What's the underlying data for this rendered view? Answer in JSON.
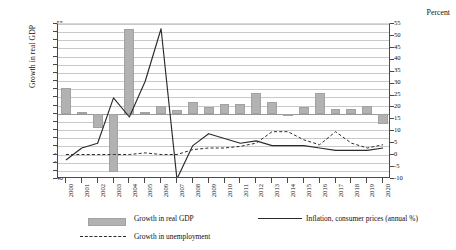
{
  "axis": {
    "y_left_title": "Growth in real GDP",
    "y_right_title": "Percent",
    "y_left_ticks": [
      "55",
      "50",
      "45",
      "40",
      "35",
      "30",
      "25",
      "20",
      "15",
      "10",
      "5",
      "0",
      "-5",
      "-10",
      "-15",
      "-20",
      "-25",
      "-30",
      "-35",
      "-40"
    ],
    "y_right_ticks": [
      "55",
      "50",
      "45",
      "40",
      "35",
      "30",
      "25",
      "20",
      "15",
      "10",
      "5",
      "0",
      "-5",
      "-10"
    ]
  },
  "legend": {
    "items": [
      {
        "label": "Growth in real GDP",
        "marker": "bar",
        "color": "#b2b2b2"
      },
      {
        "label": "Growth in unemployment",
        "marker": "dashed-line",
        "color": "#2b2b2b"
      },
      {
        "label": "Inflation, consumer prices (annual %)",
        "marker": "solid-line",
        "color": "#2b2b2b"
      }
    ]
  },
  "chart_data": {
    "type": "bar",
    "title": "",
    "xlabel": "",
    "ylabel": "Growth in real GDP",
    "y2label": "Percent",
    "grid": true,
    "legend_position": "bottom",
    "ylim": [
      -40,
      55
    ],
    "y2lim": [
      -10,
      55
    ],
    "ytick_step": 5,
    "categories": [
      "2000",
      "2001",
      "2002",
      "2003",
      "2004",
      "2005",
      "2006",
      "2007",
      "2008",
      "2009",
      "2010",
      "2011",
      "2012",
      "2013",
      "2014",
      "2015",
      "2016",
      "2017",
      "2018",
      "2019",
      "2020"
    ],
    "series": [
      {
        "name": "Growth in real GDP",
        "type": "bar",
        "axis": "left",
        "color": "#b2b2b2",
        "values": [
          16,
          1,
          -9,
          -36,
          52,
          1,
          5,
          2,
          7,
          4,
          6,
          6,
          13,
          7,
          -1,
          4,
          13,
          3,
          3,
          5,
          -6
        ]
      },
      {
        "name": "Growth in unemployment",
        "type": "dashed-line",
        "axis": "left",
        "color": "#2b2b2b",
        "values": [
          -25,
          -25,
          -25,
          -25,
          -25,
          -24,
          -25,
          -25,
          -22,
          -21,
          -21,
          -20,
          -18,
          -11,
          -11,
          -16,
          -19,
          -11,
          -18,
          -21,
          -19
        ]
      },
      {
        "name": "Inflation, consumer prices (annual %)",
        "type": "solid-line",
        "axis": "right",
        "color": "#2b2b2b",
        "values": [
          -2,
          3,
          5,
          24,
          16,
          31,
          53,
          -10,
          4,
          9,
          7,
          5,
          6,
          4,
          4,
          4,
          3,
          2,
          2,
          2,
          3
        ]
      }
    ]
  }
}
